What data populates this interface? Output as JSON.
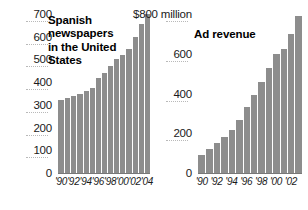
{
  "figure": {
    "background": "#ffffff",
    "bar_color": "#8d8d8d",
    "text_color": "#1a1a1a",
    "gridline_color": "#ffffff"
  },
  "chart_data": [
    {
      "type": "bar",
      "id": "spanish-newspapers",
      "title": "Spanish newspapers in the United States",
      "title_lines": [
        "Spanish",
        "newspapers",
        "in the United",
        "States"
      ],
      "xlabel": "",
      "ylabel": "",
      "ylim": [
        0,
        700
      ],
      "yticks": [
        0,
        100,
        200,
        300,
        400,
        500,
        600,
        700
      ],
      "ytick_labels": [
        "0",
        "100",
        "200",
        "300",
        "400",
        "500",
        "600",
        "700"
      ],
      "grid": true,
      "legend": "none",
      "categories": [
        "1990",
        "1991",
        "1992",
        "1993",
        "1994",
        "1995",
        "1996",
        "1997",
        "1998",
        "1999",
        "2000",
        "2001",
        "2002",
        "2003",
        "2004"
      ],
      "xtick_labels": [
        "'90",
        "'92",
        "'94",
        "'96",
        "'98",
        "'00",
        "'02",
        "'04"
      ],
      "xtick_indices": [
        0,
        2,
        4,
        6,
        8,
        10,
        12,
        14
      ],
      "values": [
        320,
        330,
        340,
        350,
        360,
        375,
        420,
        440,
        470,
        500,
        520,
        545,
        600,
        655,
        700
      ]
    },
    {
      "type": "bar",
      "id": "ad-revenue",
      "title": "Ad revenue",
      "title_lines": [
        "Ad revenue"
      ],
      "xlabel": "",
      "ylabel": "",
      "ylim": [
        0,
        800
      ],
      "yticks": [
        0,
        200,
        400,
        600,
        800
      ],
      "ytick_labels": [
        "0",
        "200",
        "400",
        "600",
        "$800 million"
      ],
      "grid": true,
      "legend": "none",
      "categories": [
        "1990",
        "1991",
        "1992",
        "1993",
        "1994",
        "1995",
        "1996",
        "1997",
        "1998",
        "1999",
        "2000",
        "2001",
        "2002",
        "2003"
      ],
      "xtick_labels": [
        "'90",
        "'92",
        "'94",
        "'96",
        "'98",
        "'00",
        "'02"
      ],
      "xtick_indices": [
        0,
        2,
        4,
        6,
        8,
        10,
        12
      ],
      "values": [
        90,
        120,
        150,
        180,
        215,
        265,
        330,
        395,
        460,
        530,
        600,
        625,
        700,
        790
      ]
    }
  ]
}
